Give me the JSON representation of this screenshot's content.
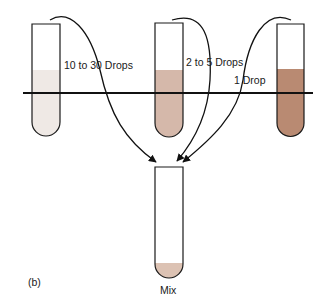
{
  "figure": {
    "panel_label": "(b)",
    "tubes": [
      {
        "id": "tube-1",
        "fill_color": "#efe9e5",
        "arrow_label": "10 to 30 Drops"
      },
      {
        "id": "tube-2",
        "fill_color": "#d5b8aa",
        "arrow_label": "2 to 5 Drops"
      },
      {
        "id": "tube-3",
        "fill_color": "#b98a72",
        "arrow_label": "1 Drop"
      }
    ],
    "mix_tube": {
      "label": "Mix",
      "fill_color": "#dcc2b3"
    },
    "colors": {
      "outline": "#1a1a1a",
      "line": "#111111"
    }
  }
}
